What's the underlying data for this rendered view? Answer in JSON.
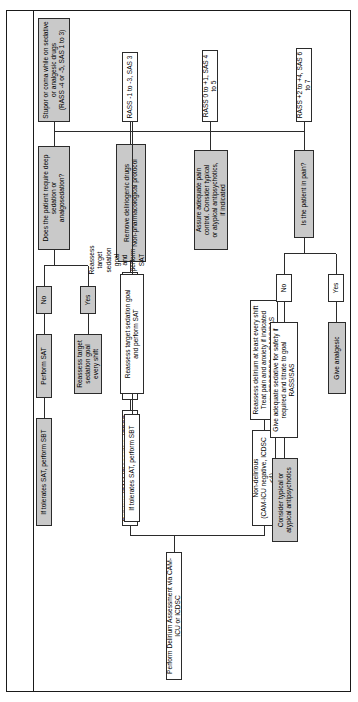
{
  "nodes": {
    "assessment": "Perform Delirium Assessment via CAM-ICU or ICDSC",
    "delirious": "Delirious (CAM-ICU positive, ICDSC ≥4)",
    "nondelirious": "Non-delirious\n(CAM-ICU negative, ICDSC <4)",
    "reassess_nondelirious": "Reassess delirium at least every shift\nTreat pain and anxiety if indicated\nvia CPOT/BPS or RASS/SAS",
    "differential": "Consider differential diagnosis (Dr. DRE or THINK)",
    "remove_drugs": "Remove deliriogenic drugs\nNon-pharmacological protocol",
    "stupor_coma": "Stupor or coma while on sedative\nor analgesic drugs\n(RASS -4 or -5, SAS 1 to 3)",
    "rass_m1_m3": "RASS -1 to -3, SAS 3",
    "rass_0_p1": "RASS 0 to +1, SAS 4 to 5",
    "rass_p2_p4": "RASS +2 to +4, SAS 6 to 7",
    "deep_sedation_q": "Does the patient require deep sedation or\nanalgosedation?",
    "yes_sedation": "Yes",
    "no_sedation": "No",
    "reassess_target_shift": "Reassess target\nsedation goal\nevery shift",
    "perform_sat": "Perform SAT",
    "reassess_target_sat": "Reassess target sedation goal\nand perform SAT",
    "if_tolerates_sat_sbt_a": "If tolerates SAT, perform SBT",
    "if_tolerates_sat_sbt_b": "If tolerates SAT, perform SBT",
    "assure_pain": "Assure adequate pain\ncontrol. Consider typical\nor atypical antipsychotics,\nif indicated",
    "pain_q": "Is the patient in pain?",
    "yes_pain": "Yes",
    "no_pain": "No",
    "give_analgesic": "Give analgesic",
    "give_sedative": "Give adequate sedative for safety if\nrequired and titrate to goal RASS/SAS",
    "consider_antipsychotics": "Consider typical or\natypical antipsychotics"
  },
  "style": {
    "shade_color": "#c9c9c9",
    "line_color": "#2b2b2b",
    "page_border": "#1a1a1a"
  }
}
